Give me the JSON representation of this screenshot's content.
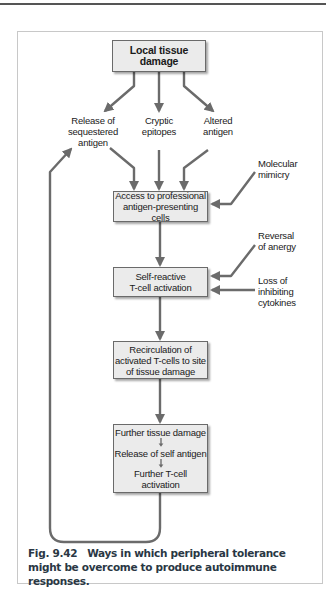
{
  "figure": {
    "number": "Fig. 9.42",
    "caption": "Ways in which peripheral tolerance might be overcome to produce autoimmune responses."
  },
  "colors": {
    "arrow": "#6b6b6b",
    "box_fill": "#ebebeb",
    "box_border": "#6a6a6a",
    "frame_border": "#c8c8c8",
    "caption_text": "#2a3744"
  },
  "nodes": {
    "local_tissue_damage": "Local tissue damage",
    "release_sequestered": [
      "Release of",
      "sequestered",
      "antigen"
    ],
    "cryptic_epitopes": [
      "Cryptic",
      "epitopes"
    ],
    "altered_antigen": [
      "Altered",
      "antigen"
    ],
    "access_apc": [
      "Access to professional",
      "antigen-presenting cells"
    ],
    "self_reactive": [
      "Self-reactive",
      "T-cell activation"
    ],
    "recirculation": [
      "Recirculation of",
      "activated T-cells to site",
      "of tissue damage"
    ],
    "further_box": {
      "steps": [
        "Further tissue damage",
        "Release of self antigen",
        "Further T-cell activation"
      ]
    }
  },
  "side_factors": {
    "molecular_mimicry": [
      "Molecular",
      "mimicry"
    ],
    "reversal_anergy": [
      "Reversal",
      "of anergy"
    ],
    "loss_cytokines": [
      "Loss of",
      "inhibiting",
      "cytokines"
    ]
  }
}
